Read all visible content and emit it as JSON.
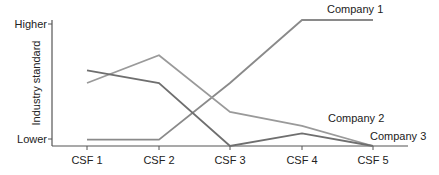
{
  "chart_data": {
    "type": "line",
    "title": "",
    "xlabel": "",
    "ylabel": "Industry standard",
    "categories": [
      "CSF 1",
      "CSF 2",
      "CSF 3",
      "CSF 4",
      "CSF 5"
    ],
    "y_tick_labels": {
      "top": "Higher",
      "bottom": "Lower"
    },
    "ylim": [
      0,
      1
    ],
    "grid": false,
    "legend": "inline labels at line ends",
    "series": [
      {
        "name": "Company 1",
        "values": [
          0.05,
          0.05,
          0.5,
          1.0,
          1.0
        ],
        "color": "#8a8a8a"
      },
      {
        "name": "Company 2",
        "values": [
          0.5,
          0.72,
          0.27,
          0.16,
          0.0
        ],
        "color": "#9a9a9a"
      },
      {
        "name": "Company 3",
        "values": [
          0.6,
          0.5,
          0.0,
          0.1,
          0.0
        ],
        "color": "#6f6f6f"
      }
    ]
  }
}
